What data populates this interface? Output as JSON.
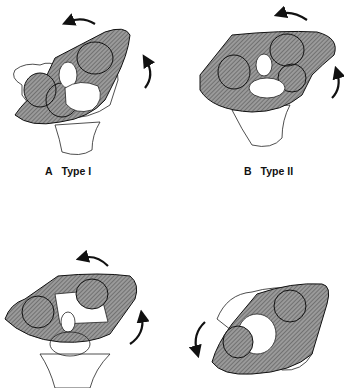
{
  "figure": {
    "panels": [
      {
        "id": "A",
        "letter": "A",
        "title": "Type I",
        "rotation_arrows": [
          "counterclockwise-top",
          "upward-right"
        ]
      },
      {
        "id": "B",
        "letter": "B",
        "title": "Type II",
        "rotation_arrows": [
          "counterclockwise-top",
          "upward-right"
        ]
      },
      {
        "id": "C",
        "letter": "",
        "title": "",
        "rotation_arrows": [
          "counterclockwise-top",
          "upward-right"
        ]
      },
      {
        "id": "D",
        "letter": "",
        "title": "",
        "rotation_arrows": [
          "downward-left"
        ]
      }
    ],
    "colors": {
      "hatch_fill": "#8a8a8a",
      "outline": "#1a1a1a",
      "background": "#ffffff"
    }
  }
}
